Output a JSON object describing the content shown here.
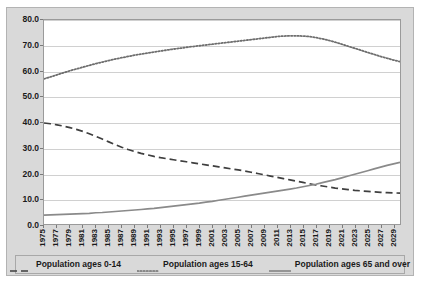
{
  "chart_data": {
    "type": "line",
    "title": "",
    "subtitle": "",
    "xlabel": "",
    "ylabel": "",
    "xlim": [
      1975,
      2030
    ],
    "ylim": [
      0,
      80
    ],
    "grid": true,
    "legend_position": "bottom",
    "y_ticks": [
      "0.0",
      "10.0",
      "20.0",
      "30.0",
      "40.0",
      "50.0",
      "60.0",
      "70.0",
      "80.0"
    ],
    "y_tick_values": [
      0,
      10,
      20,
      30,
      40,
      50,
      60,
      70,
      80
    ],
    "x_tick_labels": [
      "1975",
      "1977",
      "1979",
      "1981",
      "1983",
      "1985",
      "1987",
      "1989",
      "1991",
      "1993",
      "1995",
      "1997",
      "1999",
      "2001",
      "2003",
      "2005",
      "2007",
      "2009",
      "2011",
      "2013",
      "2015",
      "2017",
      "2019",
      "2021",
      "2023",
      "2025",
      "2027",
      "2029"
    ],
    "x": [
      1975,
      1976,
      1977,
      1978,
      1979,
      1980,
      1981,
      1982,
      1983,
      1984,
      1985,
      1986,
      1987,
      1988,
      1989,
      1990,
      1991,
      1992,
      1993,
      1994,
      1995,
      1996,
      1997,
      1998,
      1999,
      2000,
      2001,
      2002,
      2003,
      2004,
      2005,
      2006,
      2007,
      2008,
      2009,
      2010,
      2011,
      2012,
      2013,
      2014,
      2015,
      2016,
      2017,
      2018,
      2019,
      2020,
      2021,
      2022,
      2023,
      2024,
      2025,
      2026,
      2027,
      2028,
      2029,
      2030
    ],
    "series": [
      {
        "name": "Population ages 0-14",
        "style": "dashed",
        "color": "#3f3f3f",
        "values": [
          39.6,
          39.3,
          38.9,
          38.4,
          37.8,
          37.1,
          36.3,
          35.4,
          34.4,
          33.3,
          32.2,
          31.1,
          30.1,
          29.2,
          28.4,
          27.7,
          27.1,
          26.5,
          26.0,
          25.6,
          25.2,
          24.8,
          24.4,
          24.0,
          23.6,
          23.2,
          22.8,
          22.4,
          22.0,
          21.6,
          21.2,
          20.8,
          20.3,
          19.8,
          19.3,
          18.8,
          18.3,
          17.8,
          17.3,
          16.8,
          16.3,
          15.8,
          15.3,
          14.9,
          14.5,
          14.1,
          13.8,
          13.5,
          13.2,
          13.0,
          12.8,
          12.6,
          12.4,
          12.3,
          12.2,
          12.1
        ]
      },
      {
        "name": "Population ages 15-64",
        "style": "dotted",
        "color": "#6e6e6e",
        "values": [
          56.9,
          57.7,
          58.5,
          59.3,
          60.1,
          60.8,
          61.5,
          62.2,
          62.9,
          63.5,
          64.1,
          64.7,
          65.2,
          65.7,
          66.2,
          66.6,
          67.0,
          67.4,
          67.8,
          68.2,
          68.6,
          68.9,
          69.3,
          69.6,
          69.9,
          70.2,
          70.5,
          70.8,
          71.1,
          71.4,
          71.7,
          72.0,
          72.3,
          72.6,
          72.9,
          73.2,
          73.5,
          73.7,
          73.8,
          73.8,
          73.7,
          73.5,
          73.1,
          72.6,
          72.0,
          71.3,
          70.5,
          69.7,
          68.9,
          68.1,
          67.3,
          66.5,
          65.7,
          65.0,
          64.3,
          63.7
        ]
      },
      {
        "name": "Population ages 65 and over",
        "style": "solid",
        "color": "#8a8a8a",
        "values": [
          3.5,
          3.6,
          3.7,
          3.8,
          3.9,
          4.0,
          4.1,
          4.2,
          4.4,
          4.5,
          4.7,
          4.9,
          5.1,
          5.3,
          5.5,
          5.7,
          5.9,
          6.1,
          6.4,
          6.7,
          7.0,
          7.3,
          7.6,
          7.9,
          8.2,
          8.6,
          8.9,
          9.3,
          9.7,
          10.1,
          10.5,
          10.9,
          11.3,
          11.7,
          12.1,
          12.5,
          12.9,
          13.3,
          13.7,
          14.1,
          14.6,
          15.1,
          15.6,
          16.2,
          16.8,
          17.4,
          18.1,
          18.8,
          19.5,
          20.2,
          20.9,
          21.6,
          22.3,
          23.0,
          23.6,
          24.2
        ]
      }
    ]
  },
  "legend": {
    "items": [
      {
        "label": "Population ages 0-14"
      },
      {
        "label": "Population ages 15-64"
      },
      {
        "label": "Population ages 65 and over"
      }
    ]
  }
}
